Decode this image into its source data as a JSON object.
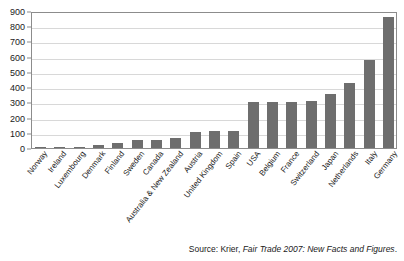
{
  "chart_data": {
    "type": "bar",
    "title": "",
    "subtitle": "",
    "xlabel": "",
    "ylabel": "",
    "ylim": [
      0,
      900
    ],
    "y_ticks": [
      900,
      800,
      700,
      600,
      500,
      400,
      300,
      200,
      100,
      0
    ],
    "grid": true,
    "legend": "none",
    "bar_color": "#6e6e6e",
    "gridline_color": "#d8d8d8",
    "axis_color": "#8c8c8c",
    "categories": [
      "Norway",
      "Ireland",
      "Luxembourg",
      "Denmark",
      "Finland",
      "Sweden",
      "Canada",
      "Australia & New Zealand",
      "Austria",
      "United Kingdom",
      "Spain",
      "USA",
      "Belgium",
      "France",
      "Switzerland",
      "Japan",
      "Netherlands",
      "Italy",
      "Germany"
    ],
    "values": [
      2,
      8,
      9,
      17,
      30,
      50,
      52,
      68,
      105,
      110,
      115,
      300,
      305,
      305,
      308,
      355,
      425,
      580,
      860
    ]
  },
  "source": {
    "label": "Source: Krier, ",
    "title": "Fair Trade 2007: New Facts and Figures",
    "suffix": "."
  }
}
